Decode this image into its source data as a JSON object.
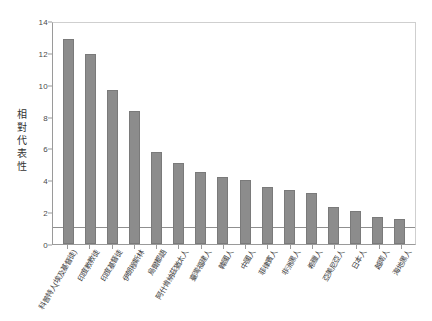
{
  "chart_data": {
    "type": "bar",
    "title": "",
    "subtitle": "",
    "xlabel": "",
    "ylabel": "相對代表性",
    "ylim": [
      0,
      14
    ],
    "yticks": [
      0,
      2,
      4,
      6,
      8,
      10,
      12,
      14
    ],
    "grid": false,
    "legend": "none",
    "bar_color": "#8c8c8c",
    "reference_line": {
      "value": 1,
      "color": "#8f8f8f",
      "label": ""
    },
    "categories": [
      "科普特人(埃及基督徒)",
      "印度教教徒",
      "印度基督徒",
      "伊朗穆斯林",
      "烏爾都語",
      "阿什肯納茲猶太人",
      "臺灣福建人",
      "韓國人",
      "中國人",
      "菲律賓人",
      "非洲黑人",
      "希臘人",
      "亞美尼亞人",
      "日本人",
      "越南人",
      "海地黑人"
    ],
    "values": [
      12.9,
      11.9,
      9.7,
      8.35,
      5.8,
      5.1,
      4.5,
      4.2,
      4.0,
      3.6,
      3.4,
      3.2,
      2.3,
      2.05,
      1.7,
      1.6
    ]
  }
}
